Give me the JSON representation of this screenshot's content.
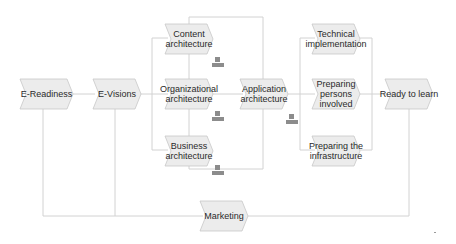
{
  "diagram": {
    "type": "process-flow",
    "colors": {
      "node_fill": "#ececec",
      "node_stroke": "#c8c8c8",
      "connector": "#d2d2d2",
      "text": "#2a2a2a",
      "icon": "#8c8c8c"
    },
    "nodes": [
      {
        "id": "e-readiness",
        "label": "E-Readiness",
        "x": 20,
        "y": 79,
        "w": 53,
        "h": 30
      },
      {
        "id": "e-visions",
        "label": "E-Visions",
        "x": 93,
        "y": 79,
        "w": 48,
        "h": 30
      },
      {
        "id": "content-architecture",
        "label": "Content architecture",
        "x": 165,
        "y": 24,
        "w": 48,
        "h": 30
      },
      {
        "id": "organizational-architecture",
        "label": "Organizational architecture",
        "x": 165,
        "y": 79,
        "w": 48,
        "h": 30
      },
      {
        "id": "business-architecture",
        "label": "Business architecture",
        "x": 165,
        "y": 136,
        "w": 48,
        "h": 30
      },
      {
        "id": "application-architecture",
        "label": "Application architecture",
        "x": 240,
        "y": 79,
        "w": 48,
        "h": 30
      },
      {
        "id": "technical-implementation",
        "label": "Technical implementation",
        "x": 312,
        "y": 24,
        "w": 48,
        "h": 30
      },
      {
        "id": "preparing-persons-involved",
        "label": "Preparing persons involved",
        "x": 312,
        "y": 79,
        "w": 48,
        "h": 30
      },
      {
        "id": "preparing-the-infrastructure",
        "label": "Preparing the infrastructure",
        "x": 312,
        "y": 136,
        "w": 48,
        "h": 30
      },
      {
        "id": "ready-to-learn",
        "label": "Ready to learn",
        "x": 385,
        "y": 79,
        "w": 48,
        "h": 30
      },
      {
        "id": "marketing",
        "label": "Marketing",
        "x": 200,
        "y": 201,
        "w": 48,
        "h": 30
      }
    ],
    "icons": [
      {
        "id": "org-icon-content",
        "name": "org-structure-icon",
        "x": 212,
        "y": 57
      },
      {
        "id": "org-icon-organizational",
        "name": "org-structure-icon",
        "x": 212,
        "y": 111
      },
      {
        "id": "org-icon-business",
        "name": "org-structure-icon",
        "x": 212,
        "y": 165
      },
      {
        "id": "org-icon-application",
        "name": "org-structure-icon",
        "x": 286,
        "y": 114
      }
    ]
  }
}
